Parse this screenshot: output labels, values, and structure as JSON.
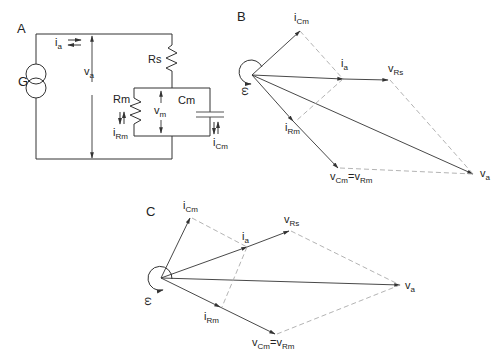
{
  "panels": {
    "A": {
      "label": "A",
      "source_label": "G",
      "current_source": "i",
      "current_source_sub": "a",
      "voltage": "v",
      "voltage_sub": "a",
      "series_resistor": "Rs",
      "membrane_resistor": "Rm",
      "membrane_capacitor": "Cm",
      "membrane_voltage": "v",
      "membrane_voltage_sub": "m",
      "resistor_current": "i",
      "resistor_current_sub": "Rm",
      "capacitor_current": "i",
      "capacitor_current_sub": "Cm"
    },
    "B": {
      "label": "B",
      "omega": "ω",
      "vectors": {
        "iCm": {
          "main": "i",
          "sub": "Cm"
        },
        "ia": {
          "main": "i",
          "sub": "a"
        },
        "vRs": {
          "main": "v",
          "sub": "Rs"
        },
        "iRm": {
          "main": "i",
          "sub": "Rm"
        },
        "vCmRm": {
          "main": "v",
          "sub": "Cm",
          "eq": "=v",
          "sub2": "Rm"
        },
        "va": {
          "main": "v",
          "sub": "a"
        }
      }
    },
    "C": {
      "label": "C",
      "omega": "ω",
      "vectors": {
        "iCm": {
          "main": "i",
          "sub": "Cm"
        },
        "ia": {
          "main": "i",
          "sub": "a"
        },
        "vRs": {
          "main": "v",
          "sub": "Rs"
        },
        "iRm": {
          "main": "i",
          "sub": "Rm"
        },
        "vCmRm": {
          "main": "v",
          "sub": "Cm",
          "eq": "=v",
          "sub2": "Rm"
        },
        "va": {
          "main": "v",
          "sub": "a"
        }
      }
    }
  },
  "colors": {
    "ink": "#333333",
    "dashed": "#aaaaaa",
    "background": "#ffffff"
  }
}
